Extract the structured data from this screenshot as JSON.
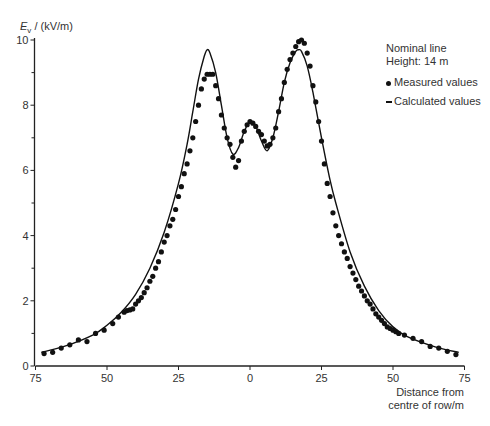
{
  "chart_data": {
    "type": "line",
    "title": "",
    "ylabel": "E_v / (kV/m)",
    "xlabel": "Distance from centre of row/m",
    "xlim": [
      -75,
      75
    ],
    "ylim": [
      0,
      10
    ],
    "x_tick_labels": [
      "75",
      "50",
      "25",
      "0",
      "25",
      "50",
      "75"
    ],
    "x_ticks": [
      -75,
      -50,
      -25,
      0,
      25,
      50,
      75
    ],
    "y_tick_labels": [
      "0",
      "2",
      "4",
      "6",
      "8",
      "10"
    ],
    "y_ticks": [
      0,
      2,
      4,
      6,
      8,
      10
    ],
    "y_minor_ticks": [
      1,
      3,
      5,
      7,
      9
    ],
    "grid": false,
    "annotation": [
      "Nominal line",
      "Height: 14 m"
    ],
    "legend": [
      {
        "name": "Measured values",
        "marker": "dot"
      },
      {
        "name": "Calculated values",
        "marker": "line"
      }
    ],
    "series": [
      {
        "name": "Calculated values",
        "style": "line",
        "x": [
          -73,
          -65,
          -55,
          -50,
          -45,
          -40,
          -35,
          -30,
          -25,
          -22,
          -20,
          -18,
          -16,
          -15,
          -14,
          -12,
          -10,
          -8,
          -6,
          -4,
          -2,
          0,
          2,
          4,
          6,
          8,
          10,
          12,
          14,
          16,
          17,
          18,
          20,
          22,
          25,
          28,
          30,
          35,
          40,
          45,
          50,
          55,
          65,
          73
        ],
        "y": [
          0.42,
          0.6,
          0.95,
          1.25,
          1.65,
          2.2,
          3.0,
          4.1,
          5.6,
          6.8,
          7.8,
          8.8,
          9.5,
          9.7,
          9.6,
          9.0,
          8.0,
          7.0,
          6.5,
          6.7,
          7.2,
          7.5,
          7.35,
          6.9,
          6.6,
          7.0,
          7.8,
          8.7,
          9.3,
          9.65,
          9.7,
          9.65,
          9.2,
          8.4,
          7.0,
          5.7,
          5.0,
          3.5,
          2.45,
          1.7,
          1.2,
          0.9,
          0.58,
          0.42
        ]
      },
      {
        "name": "Measured values",
        "style": "scatter",
        "x": [
          -72,
          -69,
          -66,
          -63,
          -60,
          -57,
          -54,
          -51,
          -48,
          -46,
          -44,
          -43,
          -42,
          -41,
          -40,
          -39,
          -38,
          -37,
          -36,
          -35,
          -34,
          -33,
          -32,
          -31,
          -30,
          -29,
          -28,
          -27,
          -26,
          -25,
          -24,
          -23,
          -22,
          -21,
          -20,
          -19,
          -18,
          -17,
          -16,
          -15,
          -14,
          -13,
          -12,
          -11,
          -10,
          -9,
          -8,
          -7,
          -6,
          -5,
          -4,
          -3,
          -2,
          -1,
          0,
          1,
          2,
          3,
          4,
          5,
          6,
          7,
          8,
          9,
          10,
          11,
          12,
          13,
          14,
          15,
          16,
          17,
          18,
          19,
          20,
          21,
          22,
          23,
          24,
          25,
          26,
          27,
          28,
          29,
          30,
          31,
          32,
          33,
          34,
          35,
          36,
          37,
          38,
          39,
          40,
          41,
          42,
          43,
          44,
          45,
          46,
          47,
          48,
          49,
          50,
          51,
          52,
          54,
          57,
          60,
          63,
          66,
          69,
          72
        ],
        "y": [
          0.38,
          0.42,
          0.55,
          0.65,
          0.8,
          0.75,
          1.0,
          1.1,
          1.3,
          1.5,
          1.65,
          1.7,
          1.72,
          1.75,
          1.9,
          2.0,
          2.1,
          2.25,
          2.4,
          2.6,
          2.75,
          3.0,
          3.2,
          3.5,
          3.8,
          4.0,
          4.3,
          4.5,
          4.8,
          5.2,
          5.5,
          5.9,
          6.2,
          6.6,
          7.0,
          7.5,
          8.0,
          8.5,
          8.8,
          8.95,
          8.95,
          8.95,
          8.6,
          8.2,
          7.7,
          7.3,
          7.0,
          6.8,
          6.4,
          6.1,
          6.3,
          6.9,
          7.2,
          7.4,
          7.5,
          7.45,
          7.35,
          7.2,
          7.1,
          6.9,
          6.75,
          6.8,
          7.0,
          7.3,
          7.8,
          8.2,
          8.7,
          9.1,
          9.4,
          9.6,
          9.8,
          9.95,
          10.0,
          9.9,
          9.6,
          9.2,
          8.6,
          8.1,
          7.5,
          6.9,
          6.2,
          5.6,
          5.2,
          4.7,
          4.3,
          4.0,
          3.75,
          3.5,
          3.3,
          3.05,
          2.85,
          2.65,
          2.45,
          2.3,
          2.15,
          2.0,
          1.9,
          1.75,
          1.6,
          1.5,
          1.4,
          1.3,
          1.2,
          1.15,
          1.1,
          1.05,
          1.0,
          0.95,
          0.85,
          0.75,
          0.6,
          0.55,
          0.45,
          0.35
        ]
      }
    ]
  }
}
